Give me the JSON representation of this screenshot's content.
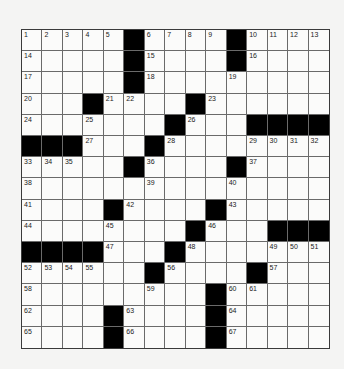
{
  "puzzle": {
    "rows": 15,
    "cols": 15,
    "colors": {
      "background": "#f4f4f3",
      "cell": "#fbfbfa",
      "block": "#000000",
      "gridline": "#6a6a6a"
    },
    "layout": [
      "1 2 3 4 5 # 6 7 8 9 # 10 11 12 13",
      "14 . . . . # 15 . . . # 16 . . .",
      "17 . . . . # 18 . . . 19 . . . .",
      "20 . . # 21 22 . . # 23 . . . . .",
      "24 . . 25 . . . # 26 . . # # # #",
      "# # # 27 . . # 28 . . . 29 30 31 32",
      "33 34 35 . . # 36 . . . # 37 . . .",
      "38 . . . . . 39 . . . 40 . . . .",
      "41 . . . # 42 . . . # 43 . . . .",
      "44 . . . 45 . . . # 46 . . # # #",
      "# # # # 47 . . # 48 . . . 49 50 51",
      "52 53 54 55 . . # 56 . . . # 57 . .",
      "58 . . . . . 59 . . # 60 61 . . .",
      "62 . . . # 63 . . . # 64 . . . .",
      "65 . . . # 66 . . . # 67 . . . ."
    ]
  }
}
